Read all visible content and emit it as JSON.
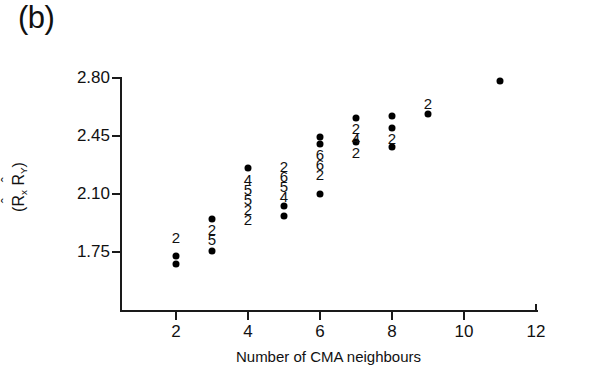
{
  "panel": {
    "label": "(b)"
  },
  "chart_data": {
    "type": "scatter",
    "title": "",
    "subtitle": "",
    "xlabel": "Number of CMA neighbours",
    "ylabel": "(R̂x R̂y)",
    "ylabel_parts": {
      "open": "(",
      "var1_base": "R",
      "var1_hat": "ˆ",
      "var1_sub": "x",
      "var2_base": "R",
      "var2_hat": "ˆ",
      "var2_sub": "Y",
      "close": ")"
    },
    "xlim": [
      1.0,
      12.0
    ],
    "ylim": [
      1.62,
      2.84
    ],
    "xticks": [
      2,
      4,
      6,
      8,
      10,
      12
    ],
    "xtick_labels": [
      "2",
      "4",
      "6",
      "8",
      "10",
      "12"
    ],
    "yticks": [
      2.8,
      2.45,
      2.1,
      1.75
    ],
    "ytick_labels": [
      "2.80",
      "2.45",
      "2.10",
      "1.75"
    ],
    "grid": false,
    "legend": null,
    "marker": "filled-circle",
    "marker_color": "#000000",
    "points": [
      {
        "x": 2,
        "y": 1.723
      },
      {
        "x": 2,
        "y": 1.678
      },
      {
        "x": 3,
        "y": 1.952
      },
      {
        "x": 3,
        "y": 1.758
      },
      {
        "x": 4,
        "y": 2.258
      },
      {
        "x": 5,
        "y": 2.03
      },
      {
        "x": 5,
        "y": 1.97
      },
      {
        "x": 6,
        "y": 2.443
      },
      {
        "x": 6,
        "y": 2.4
      },
      {
        "x": 6,
        "y": 2.102
      },
      {
        "x": 7,
        "y": 2.56
      },
      {
        "x": 7,
        "y": 2.412
      },
      {
        "x": 8,
        "y": 2.572
      },
      {
        "x": 8,
        "y": 2.5
      },
      {
        "x": 8,
        "y": 2.385
      },
      {
        "x": 9,
        "y": 2.582
      },
      {
        "x": 11,
        "y": 2.782
      }
    ],
    "count_annotations": [
      {
        "x": 2,
        "y": 1.838,
        "text": "2"
      },
      {
        "x": 3,
        "y": 1.89,
        "text": "2"
      },
      {
        "x": 3,
        "y": 1.83,
        "text": "5"
      },
      {
        "x": 4,
        "y": 2.19,
        "text": "4"
      },
      {
        "x": 4,
        "y": 2.13,
        "text": "5"
      },
      {
        "x": 4,
        "y": 2.07,
        "text": "5"
      },
      {
        "x": 4,
        "y": 2.01,
        "text": "2"
      },
      {
        "x": 4,
        "y": 1.95,
        "text": "2"
      },
      {
        "x": 5,
        "y": 2.27,
        "text": "2"
      },
      {
        "x": 5,
        "y": 2.21,
        "text": "6"
      },
      {
        "x": 5,
        "y": 2.15,
        "text": "5"
      },
      {
        "x": 5,
        "y": 2.09,
        "text": "4"
      },
      {
        "x": 6,
        "y": 2.34,
        "text": "6"
      },
      {
        "x": 6,
        "y": 2.28,
        "text": "6"
      },
      {
        "x": 6,
        "y": 2.22,
        "text": "2"
      },
      {
        "x": 7,
        "y": 2.5,
        "text": "2"
      },
      {
        "x": 7,
        "y": 2.44,
        "text": "4"
      },
      {
        "x": 7,
        "y": 2.352,
        "text": "2"
      },
      {
        "x": 8,
        "y": 2.44,
        "text": "2"
      },
      {
        "x": 9,
        "y": 2.648,
        "text": "2"
      }
    ]
  }
}
